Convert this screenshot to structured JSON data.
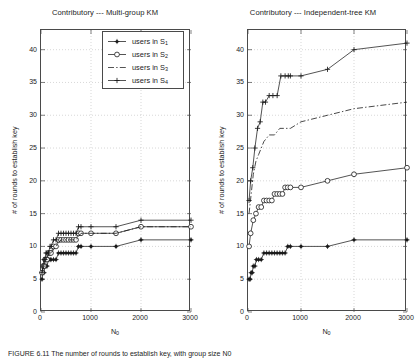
{
  "figure": {
    "caption": "FIGURE 6.11   The number of rounds to establish key, with group size N0",
    "ylabel": "# of rounds to establish key",
    "xlabel_main": "N",
    "xlabel_sub": "0",
    "axis": {
      "xticks": [
        0,
        1000,
        2000,
        3000
      ],
      "yticks": [
        0,
        5,
        10,
        15,
        20,
        25,
        30,
        35,
        40
      ],
      "xlim": [
        0,
        3000
      ],
      "ylim": [
        0,
        43
      ],
      "grid": true,
      "grid_color": "#bdbdbd"
    }
  },
  "legend": {
    "position": "upper-left-of-left-panel",
    "items": [
      {
        "label_prefix": "users in S",
        "label_sub": "1",
        "marker": "filled-star",
        "line": "solid"
      },
      {
        "label_prefix": "users in S",
        "label_sub": "2",
        "marker": "open-circle",
        "line": "solid"
      },
      {
        "label_prefix": "users in S",
        "label_sub": "3",
        "marker": "none",
        "line": "dash-dot"
      },
      {
        "label_prefix": "users in S",
        "label_sub": "4",
        "marker": "plus",
        "line": "solid"
      }
    ]
  },
  "chart_data": [
    {
      "id": "multi-group-km",
      "type": "line",
      "title": "Contributory --- Multi-group KM",
      "xlabel": "N0",
      "ylabel": "# of rounds to establish key",
      "xlim": [
        0,
        3000
      ],
      "ylim": [
        0,
        43
      ],
      "grid": true,
      "series": [
        {
          "name": "users in S1",
          "marker": "filled-star",
          "line": "solid",
          "x": [
            20,
            40,
            60,
            80,
            100,
            120,
            150,
            180,
            200,
            250,
            300,
            350,
            400,
            450,
            500,
            550,
            600,
            650,
            700,
            750,
            800,
            1000,
            1500,
            2000,
            3000
          ],
          "y": [
            5,
            6,
            6,
            7,
            7,
            7,
            8,
            8,
            8,
            8,
            8,
            9,
            9,
            9,
            9,
            9,
            9,
            9,
            9,
            10,
            10,
            10,
            10,
            11,
            11
          ]
        },
        {
          "name": "users in S2",
          "marker": "open-circle",
          "line": "solid",
          "x": [
            20,
            40,
            60,
            80,
            100,
            120,
            150,
            180,
            200,
            250,
            300,
            350,
            400,
            450,
            500,
            550,
            600,
            650,
            700,
            750,
            800,
            1000,
            1500,
            2000,
            3000
          ],
          "y": [
            6,
            7,
            7,
            8,
            8,
            8,
            9,
            9,
            9,
            10,
            10,
            11,
            11,
            11,
            11,
            11,
            11,
            11,
            11,
            12,
            12,
            12,
            12,
            13,
            13
          ]
        },
        {
          "name": "users in S3",
          "marker": "none",
          "line": "dash-dot",
          "x": [
            20,
            60,
            100,
            150,
            200,
            300,
            400,
            500,
            600,
            700,
            800,
            1000,
            1500,
            2000,
            3000
          ],
          "y": [
            6,
            7,
            8,
            9,
            9,
            10,
            11,
            11,
            11,
            11,
            12,
            12,
            12,
            13,
            13
          ]
        },
        {
          "name": "users in S4",
          "marker": "plus",
          "line": "solid",
          "x": [
            20,
            40,
            60,
            80,
            100,
            120,
            150,
            180,
            200,
            250,
            300,
            350,
            400,
            450,
            500,
            550,
            600,
            650,
            700,
            750,
            800,
            1000,
            1500,
            2000,
            3000
          ],
          "y": [
            6,
            7,
            8,
            8,
            9,
            9,
            9,
            10,
            10,
            11,
            11,
            12,
            12,
            12,
            12,
            12,
            12,
            12,
            12,
            13,
            13,
            13,
            13,
            14,
            14
          ]
        }
      ]
    },
    {
      "id": "independent-tree-km",
      "type": "line",
      "title": "Contributory --- Independent-tree KM",
      "xlabel": "N0",
      "ylabel": "# of rounds to establish key",
      "xlim": [
        0,
        3000
      ],
      "ylim": [
        0,
        43
      ],
      "grid": true,
      "series": [
        {
          "name": "users in S1",
          "marker": "filled-star",
          "line": "solid",
          "x": [
            20,
            40,
            60,
            80,
            100,
            130,
            160,
            200,
            250,
            300,
            350,
            400,
            450,
            500,
            550,
            600,
            650,
            700,
            750,
            800,
            1000,
            1500,
            2000,
            3000
          ],
          "y": [
            5,
            5,
            6,
            6,
            7,
            7,
            8,
            8,
            8,
            9,
            9,
            9,
            9,
            9,
            9,
            9,
            9,
            9,
            10,
            10,
            10,
            10,
            11,
            11
          ]
        },
        {
          "name": "users in S2",
          "marker": "open-circle",
          "line": "solid",
          "x": [
            20,
            50,
            100,
            150,
            200,
            250,
            300,
            350,
            400,
            450,
            500,
            550,
            600,
            650,
            700,
            750,
            800,
            1000,
            1500,
            2000,
            3000
          ],
          "y": [
            10,
            12,
            14,
            15,
            16,
            16,
            17,
            17,
            17,
            17,
            18,
            18,
            18,
            18,
            19,
            19,
            19,
            19,
            20,
            21,
            22
          ]
        },
        {
          "name": "users in S3",
          "marker": "none",
          "line": "dash-dot",
          "x": [
            20,
            60,
            100,
            150,
            200,
            300,
            400,
            500,
            600,
            700,
            800,
            1000,
            1500,
            2000,
            3000
          ],
          "y": [
            15,
            18,
            21,
            23,
            24,
            26,
            27,
            27,
            28,
            28,
            28,
            29,
            30,
            31,
            32
          ]
        },
        {
          "name": "users in S4",
          "marker": "plus",
          "line": "solid",
          "x": [
            20,
            50,
            90,
            130,
            180,
            230,
            280,
            330,
            400,
            470,
            550,
            620,
            700,
            760,
            800,
            1000,
            1500,
            2000,
            3000
          ],
          "y": [
            17,
            20,
            22,
            25,
            28,
            29,
            32,
            32,
            33,
            33,
            33,
            36,
            36,
            36,
            36,
            36,
            37,
            40,
            41
          ]
        }
      ]
    }
  ]
}
